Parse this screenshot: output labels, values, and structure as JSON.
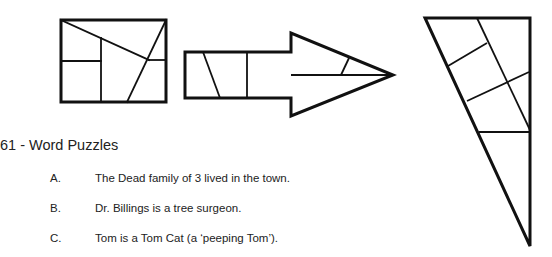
{
  "figures": [
    {
      "name": "divided-rectangle-figure"
    },
    {
      "name": "divided-arrow-figure"
    },
    {
      "name": "divided-triangle-figure"
    }
  ],
  "section": {
    "heading": "61 - Word Puzzles",
    "items": [
      {
        "letter": "A.",
        "text": "The Dead family of 3 lived in the town."
      },
      {
        "letter": "B.",
        "text": "Dr. Billings is a tree surgeon."
      },
      {
        "letter": "C.",
        "text": "Tom is a Tom Cat (a ‘peeping Tom’)."
      }
    ]
  }
}
